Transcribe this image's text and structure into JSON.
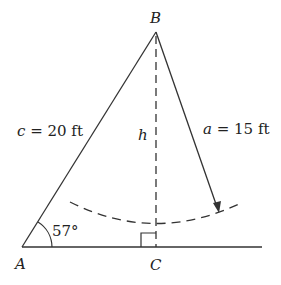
{
  "diagram": {
    "vertices": {
      "A": "A",
      "B": "B",
      "C": "C"
    },
    "side_c": {
      "var": "c",
      "value": " = 20 ft"
    },
    "side_a": {
      "var": "a",
      "value": " = 15 ft"
    },
    "height": "h",
    "angle_A": "57°",
    "colors": {
      "stroke": "#333333",
      "text": "#222222"
    }
  }
}
